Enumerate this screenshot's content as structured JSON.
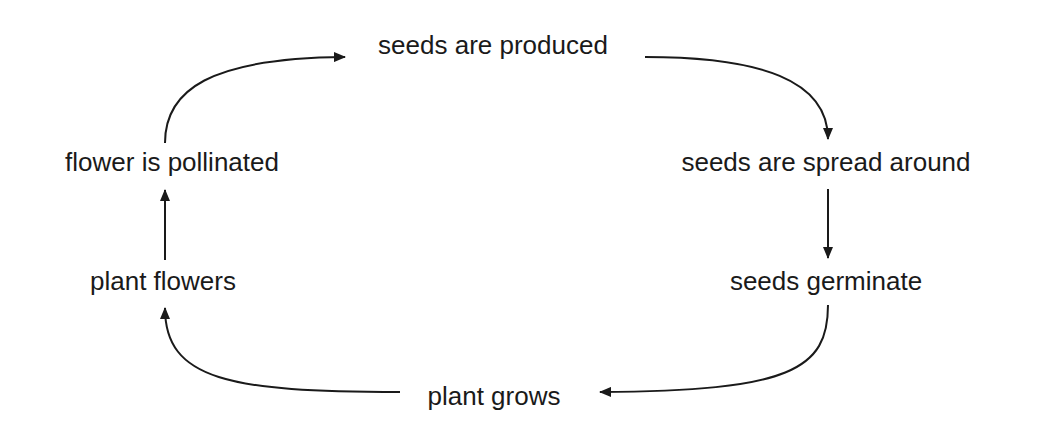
{
  "diagram": {
    "type": "cycle",
    "title": "",
    "nodes": [
      {
        "id": "seeds_produced",
        "label": "seeds are produced"
      },
      {
        "id": "seeds_spread",
        "label": "seeds are spread around"
      },
      {
        "id": "seeds_germinate",
        "label": "seeds germinate"
      },
      {
        "id": "plant_grows",
        "label": "plant grows"
      },
      {
        "id": "plant_flowers",
        "label": "plant flowers"
      },
      {
        "id": "flower_pollinated",
        "label": "flower is pollinated"
      }
    ],
    "edges": [
      {
        "from": "seeds_produced",
        "to": "seeds_spread"
      },
      {
        "from": "seeds_spread",
        "to": "seeds_germinate"
      },
      {
        "from": "seeds_germinate",
        "to": "plant_grows"
      },
      {
        "from": "plant_grows",
        "to": "plant_flowers"
      },
      {
        "from": "plant_flowers",
        "to": "flower_pollinated"
      },
      {
        "from": "flower_pollinated",
        "to": "seeds_produced"
      }
    ],
    "colors": {
      "ink": "#1a1a1a",
      "background": "#ffffff"
    }
  }
}
